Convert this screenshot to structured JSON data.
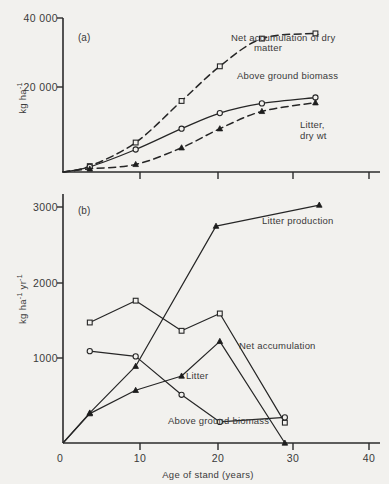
{
  "figure": {
    "background_color": "#f2f1ee",
    "ink_color": "#262626"
  },
  "chart_data": [
    {
      "type": "line",
      "panel": "(a)",
      "title": "",
      "xlabel": "",
      "ylabel": "kg ha-1",
      "ylabel_parts": {
        "base": "kg ha",
        "exponent": "-1"
      },
      "xlim": [
        0,
        40
      ],
      "ylim": [
        0,
        43000
      ],
      "xticks": [
        0,
        10,
        20,
        30,
        40
      ],
      "xticklabels": [
        "",
        "",
        "",
        "",
        ""
      ],
      "yticks": [
        20000,
        40000
      ],
      "yticklabels": [
        "20 000",
        "40 000"
      ],
      "grid": false,
      "legend": "inline-annotations",
      "series": [
        {
          "name": "Net accumulation of dry matter",
          "label": "Net accumulation of dry",
          "label_line2": "matter",
          "style": "dashed",
          "marker": "open-square",
          "x": [
            0,
            3.5,
            9.5,
            15.5,
            20.5,
            26,
            33
          ],
          "y": [
            0,
            1700,
            8500,
            20500,
            30500,
            38500,
            40000
          ]
        },
        {
          "name": "Above ground biomass",
          "label": "Above ground biomass",
          "style": "solid",
          "marker": "open-circle",
          "x": [
            0,
            3.5,
            9.5,
            15.5,
            20.5,
            26,
            33
          ],
          "y": [
            0,
            1500,
            6500,
            12500,
            17000,
            19800,
            21500
          ]
        },
        {
          "name": "Litter, dry wt",
          "label": "Litter,",
          "label_line2": "dry wt",
          "style": "dashed",
          "marker": "filled-triangle",
          "x": [
            0,
            3.5,
            9.5,
            15.5,
            20.5,
            26,
            33
          ],
          "y": [
            0,
            900,
            2200,
            7000,
            12500,
            17500,
            20000
          ]
        }
      ]
    },
    {
      "type": "line",
      "panel": "(b)",
      "title": "",
      "xlabel": "Age of stand (years)",
      "ylabel": "kg ha-1 yr-1",
      "ylabel_parts": {
        "base1": "kg ha",
        "exp1": "-1",
        "base2": "yr",
        "exp2": "-1"
      },
      "xlim": [
        0,
        40
      ],
      "ylim": [
        0,
        3300
      ],
      "xticks": [
        0,
        10,
        20,
        30,
        40
      ],
      "xticklabels": [
        "0",
        "10",
        "20",
        "30",
        "40"
      ],
      "yticks": [
        1000,
        2000,
        3000
      ],
      "yticklabels": [
        "1000",
        "2000",
        "3000"
      ],
      "grid": false,
      "legend": "inline-annotations",
      "series": [
        {
          "name": "Litter production",
          "label": "Litter production",
          "style": "solid",
          "marker": "filled-triangle",
          "x": [
            0,
            3.5,
            9.5,
            20,
            33.5
          ],
          "y": [
            0,
            400,
            1020,
            2880,
            3160
          ]
        },
        {
          "name": "Net accumulation",
          "label": "Net accumulation",
          "style": "solid",
          "marker": "open-square",
          "x": [
            3.5,
            9.5,
            15.5,
            20.5,
            29
          ],
          "y": [
            1600,
            1890,
            1490,
            1720,
            270
          ]
        },
        {
          "name": "Litter",
          "label": "Litter",
          "style": "solid",
          "marker": "filled-triangle",
          "x": [
            0,
            3.5,
            9.5,
            15.5,
            20.5,
            29
          ],
          "y": [
            0,
            390,
            700,
            890,
            1350,
            0
          ]
        },
        {
          "name": "Above ground biomass",
          "label": "Above ground biomass",
          "style": "solid",
          "marker": "open-circle",
          "x": [
            3.5,
            9.5,
            15.5,
            20.5,
            29
          ],
          "y": [
            1220,
            1150,
            640,
            280,
            340
          ]
        }
      ]
    }
  ]
}
